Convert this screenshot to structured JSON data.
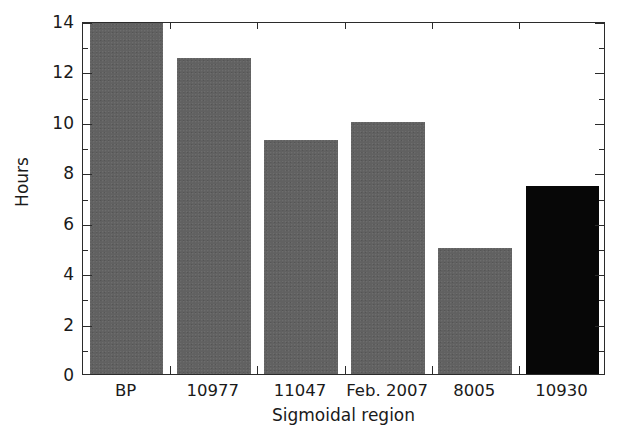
{
  "figure": {
    "partial_title": "",
    "background_color": "#ffffff",
    "bar_color": "#616161",
    "highlight_color": "#070707",
    "axis_color": "#2b2b2b"
  },
  "chart_data": {
    "type": "bar",
    "title": "",
    "xlabel": "Sigmoidal region",
    "ylabel": "Hours",
    "categories": [
      "BP",
      "10977",
      "11047",
      "Feb. 2007",
      "8005",
      "10930"
    ],
    "values": [
      14.6,
      12.55,
      9.3,
      10.0,
      5.0,
      7.45
    ],
    "clipped": [
      true,
      false,
      false,
      false,
      false,
      false
    ],
    "highlight_index": 5,
    "ylim": [
      0,
      14
    ],
    "ytick_labels": [
      "0",
      "2",
      "4",
      "6",
      "8",
      "10",
      "12",
      "14"
    ],
    "ytick_values": [
      0,
      2,
      4,
      6,
      8,
      10,
      12,
      14
    ],
    "yminor_values": [
      1,
      3,
      5,
      7,
      9,
      11,
      13
    ],
    "grid": false,
    "legend": "none",
    "tick_direction": "in",
    "frame": "box"
  }
}
